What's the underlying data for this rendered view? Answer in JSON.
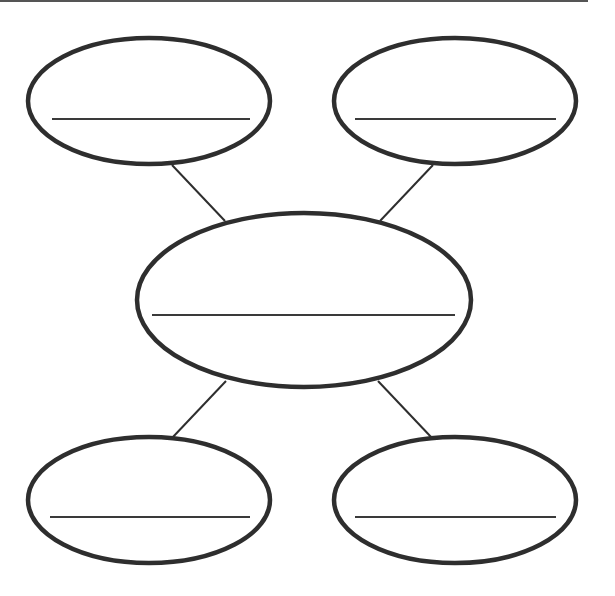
{
  "diagram": {
    "type": "concept-map-worksheet",
    "stroke_color": "#2e2e2e",
    "background": "#ffffff",
    "top_rule": {
      "x1": 0,
      "y1": 1,
      "x2": 588,
      "y2": 1
    },
    "nodes": [
      {
        "id": "center",
        "cx": 304,
        "cy": 300,
        "rx": 167,
        "ry": 87,
        "line": {
          "x1": 152,
          "x2": 455,
          "y": 315
        },
        "label": ""
      },
      {
        "id": "top-left",
        "cx": 149,
        "cy": 101,
        "rx": 121,
        "ry": 63,
        "line": {
          "x1": 52,
          "x2": 250,
          "y": 119
        },
        "label": ""
      },
      {
        "id": "top-right",
        "cx": 455,
        "cy": 101,
        "rx": 121,
        "ry": 63,
        "line": {
          "x1": 355,
          "x2": 556,
          "y": 119
        },
        "label": ""
      },
      {
        "id": "bottom-left",
        "cx": 149,
        "cy": 500,
        "rx": 121,
        "ry": 63,
        "line": {
          "x1": 50,
          "x2": 250,
          "y": 517
        },
        "label": ""
      },
      {
        "id": "bottom-right",
        "cx": 455,
        "cy": 500,
        "rx": 121,
        "ry": 63,
        "line": {
          "x1": 355,
          "x2": 556,
          "y": 517
        },
        "label": ""
      }
    ],
    "connectors": [
      {
        "from": "top-left",
        "to": "center",
        "x1": 172,
        "y1": 165,
        "x2": 225,
        "y2": 221
      },
      {
        "from": "top-right",
        "to": "center",
        "x1": 433,
        "y1": 165,
        "x2": 380,
        "y2": 221
      },
      {
        "from": "bottom-left",
        "to": "center",
        "x1": 226,
        "y1": 381,
        "x2": 172,
        "y2": 438
      },
      {
        "from": "bottom-right",
        "to": "center",
        "x1": 378,
        "y1": 381,
        "x2": 432,
        "y2": 438
      }
    ]
  }
}
